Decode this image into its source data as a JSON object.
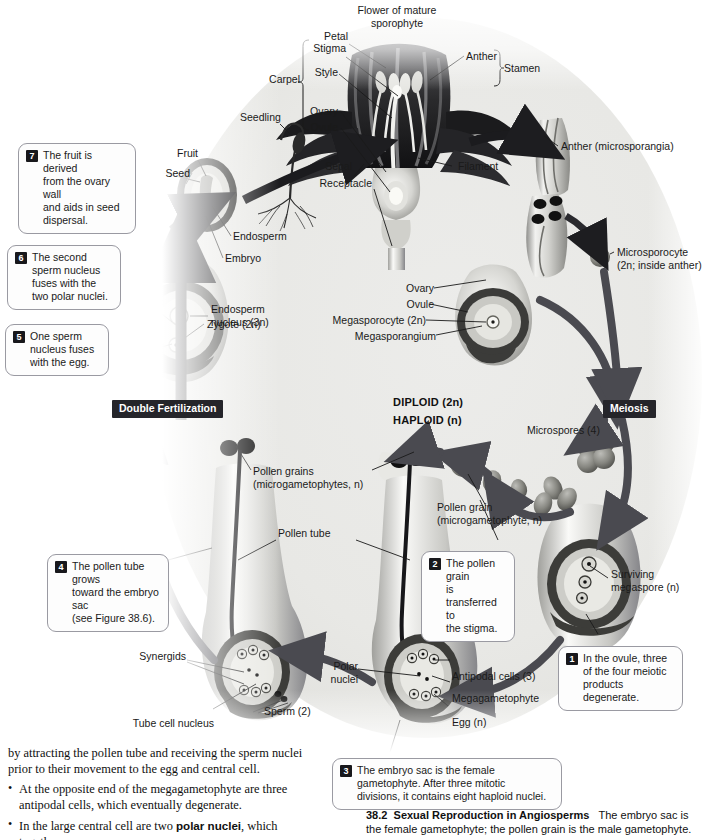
{
  "figure": {
    "title_top": "Flower of mature\nsporophyte",
    "ploidy_diploid": "DIPLOID (2n)",
    "ploidy_haploid": "HAPLOID (n)"
  },
  "banners": {
    "double_fertilization": "Double Fertilization",
    "meiosis": "Meiosis"
  },
  "labels": {
    "flower_of_mature_sporophyte": "Flower of mature\nsporophyte",
    "petal": "Petal",
    "stigma": "Stigma",
    "style": "Style",
    "carpel": "Carpel",
    "ovary_flower": "Ovary",
    "ovule_flower": "Ovule",
    "sepal": "Sepal",
    "receptacle": "Receptacle",
    "anther": "Anther",
    "stamen": "Stamen",
    "filament": "Filament",
    "anther_microsporangia": "Anther (microsporangia)",
    "microsporocyte": "Microsporocyte\n(2n; inside anther)",
    "seedling": "Seedling",
    "fruit": "Fruit",
    "seed": "Seed",
    "endosperm": "Endosperm",
    "embryo": "Embryo",
    "endosperm_nucleus": "Endosperm\nnucleus (3n)",
    "zygote": "Zygote (2n)",
    "ovary_cycle": "Ovary",
    "ovule_cycle": "Ovule",
    "megasporocyte": "Megasporocyte (2n)",
    "megasporangium": "Megasporangium",
    "microspores": "Microspores (4)",
    "pollen_grains": "Pollen grains\n(microgametophytes, n)",
    "pollen_grain": "Pollen grain\n(microgametophyte, n)",
    "pollen_tube": "Pollen tube",
    "surviving_megaspore": "Surviving\nmegaspore (n)",
    "synergids": "Synergids",
    "sperm": "Sperm (2)",
    "tube_cell_nucleus": "Tube cell nucleus",
    "polar_nuclei": "Polar\nnuclei",
    "antipodal_cells": "Antipodal cells (3)",
    "megagametophyte": "Megagametophyte",
    "egg": "Egg (n)"
  },
  "callouts": [
    {
      "num": "1",
      "text": "In the ovule, three\nof the four meiotic\nproducts degenerate."
    },
    {
      "num": "2",
      "text": "The pollen grain\nis transferred to\nthe stigma."
    },
    {
      "num": "3",
      "text": "The embryo sac is the female\ngametophyte. After three mitotic\ndivisions, it contains eight haploid nuclei."
    },
    {
      "num": "4",
      "text": "The pollen tube grows\ntoward the embryo sac\n(see Figure 38.6)."
    },
    {
      "num": "5",
      "text": "One sperm\nnucleus fuses\nwith the egg."
    },
    {
      "num": "6",
      "text": "The second\nsperm nucleus\nfuses with the\ntwo polar nuclei."
    },
    {
      "num": "7",
      "text": "The fruit is derived\nfrom the ovary wall\nand aids in seed\ndispersal."
    }
  ],
  "body_text": {
    "paragraph": "by attracting the pollen tube and receiving the sperm nuclei prior to their movement to the egg and central cell.",
    "bullet1": "At the opposite end of the megagametophyte are three antipodal cells, which eventually degenerate.",
    "bullet2_pre": "In the large central cell are two ",
    "bullet2_bold": "polar nuclei",
    "bullet2_post": ", which together"
  },
  "caption": {
    "number": "38.2",
    "title": "Sexual Reproduction in Angiosperms",
    "text": "The embryo sac is the female gametophyte; the pollen grain is the male gametophyte."
  },
  "colors": {
    "banner_bg": "#25252a",
    "callout_border": "#9a9aa2",
    "arrow": "#4a4a50",
    "field": "#e8e8e5"
  }
}
